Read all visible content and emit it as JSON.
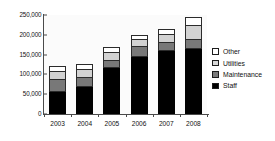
{
  "chart_data": {
    "type": "bar",
    "subtype": "stacked-vertical",
    "title": "",
    "xlabel": "",
    "ylabel": "",
    "categories": [
      "2003",
      "2004",
      "2005",
      "2006",
      "2007",
      "2008"
    ],
    "ylim": [
      0,
      250000
    ],
    "yticks": [
      0,
      50000,
      100000,
      150000,
      200000,
      250000
    ],
    "ytick_labels": [
      "0",
      "50,000",
      "100,000",
      "150,000",
      "200,000",
      "250,000"
    ],
    "grid": false,
    "legend_position": "right",
    "series": [
      {
        "name": "Staff",
        "color": "#000000",
        "values": [
          55000,
          68000,
          115000,
          145000,
          158000,
          163000
        ]
      },
      {
        "name": "Maintenance",
        "color": "#787878",
        "values": [
          32000,
          22000,
          18000,
          25000,
          22000,
          25000
        ]
      },
      {
        "name": "Utilities",
        "color": "#d2d2d2",
        "values": [
          20000,
          22000,
          22000,
          18000,
          20000,
          35000
        ]
      },
      {
        "name": "Other",
        "color": "#ffffff",
        "values": [
          15000,
          15000,
          15000,
          12000,
          15000,
          22000
        ]
      }
    ],
    "totals": [
      122000,
      127000,
      170000,
      200000,
      215000,
      245000
    ]
  },
  "legend": {
    "items": [
      {
        "label": "Other",
        "swatch": "white-square-swatch"
      },
      {
        "label": "Utilities",
        "swatch": "light-gray-square-swatch"
      },
      {
        "label": "Maintenance",
        "swatch": "dark-gray-square-swatch"
      },
      {
        "label": "Staff",
        "swatch": "black-square-swatch"
      }
    ]
  },
  "axes": {
    "y_labels": [
      "250,000",
      "200,000",
      "150,000",
      "100,000",
      "50,000",
      "0"
    ],
    "x_labels": [
      "2003",
      "2004",
      "2005",
      "2006",
      "2007",
      "2008"
    ]
  }
}
